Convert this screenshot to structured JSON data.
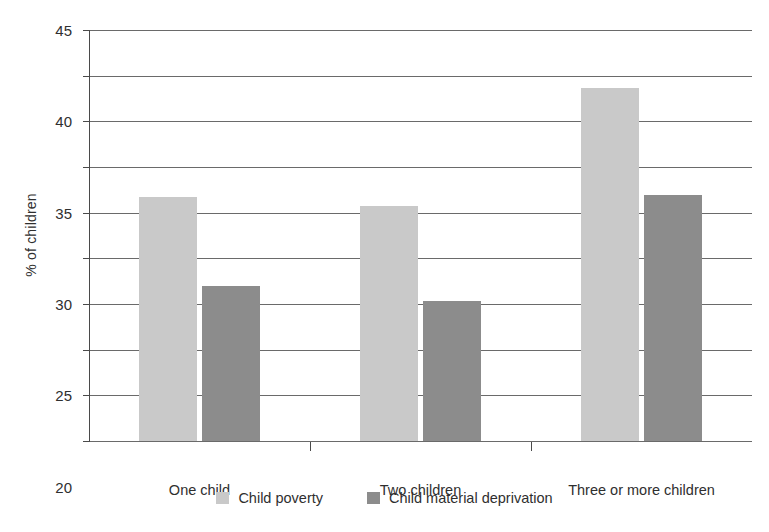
{
  "chart_data": {
    "type": "bar",
    "title": "",
    "subtitle": "",
    "xlabel": "",
    "ylabel": "% of children",
    "ylim": [
      0,
      45
    ],
    "ytick_step": 5,
    "yticks": [
      0,
      5,
      10,
      15,
      20,
      25,
      30,
      35,
      40,
      45
    ],
    "ytick_labels": [
      "0",
      "5",
      "10",
      "15",
      "20",
      "25",
      "30",
      "35",
      "40",
      "45"
    ],
    "categories": [
      "One child",
      "Two children",
      "Three or more children"
    ],
    "series": [
      {
        "name": "Child poverty",
        "color": "#c9c9c9",
        "values": [
          26.7,
          25.7,
          38.6
        ]
      },
      {
        "name": "Child material deprivation",
        "color": "#8c8c8c",
        "values": [
          17.0,
          15.3,
          26.9
        ]
      }
    ],
    "grid": "horizontal",
    "legend_position": "bottom",
    "annotations": []
  },
  "colors": {
    "series_poverty": "#c9c9c9",
    "series_deprivation": "#8c8c8c",
    "axis": "#4a4a4a",
    "gridline": "#6a6a6a",
    "text": "#2f2f2f",
    "background": "#ffffff"
  }
}
